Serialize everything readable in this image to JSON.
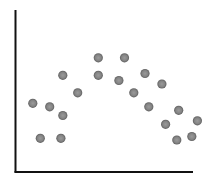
{
  "chart_data": {
    "type": "scatter",
    "title": "",
    "xlabel": "",
    "ylabel": "",
    "grid": false,
    "legend": null,
    "xlim": [
      0,
      100
    ],
    "ylim": [
      0,
      100
    ],
    "ticks": {
      "x": [],
      "y": []
    },
    "series": [
      {
        "name": "points",
        "color": "#808080",
        "points": [
          {
            "x": 9,
            "y": 41
          },
          {
            "x": 18,
            "y": 39
          },
          {
            "x": 25,
            "y": 34
          },
          {
            "x": 13,
            "y": 21
          },
          {
            "x": 24,
            "y": 21
          },
          {
            "x": 25,
            "y": 57
          },
          {
            "x": 33,
            "y": 47
          },
          {
            "x": 44,
            "y": 67
          },
          {
            "x": 44,
            "y": 57
          },
          {
            "x": 58,
            "y": 67
          },
          {
            "x": 55,
            "y": 54
          },
          {
            "x": 63,
            "y": 47
          },
          {
            "x": 69,
            "y": 58
          },
          {
            "x": 71,
            "y": 39
          },
          {
            "x": 78,
            "y": 52
          },
          {
            "x": 80,
            "y": 29
          },
          {
            "x": 87,
            "y": 37
          },
          {
            "x": 86,
            "y": 20
          },
          {
            "x": 94,
            "y": 22
          },
          {
            "x": 97,
            "y": 31
          }
        ]
      }
    ]
  },
  "style": {
    "axis_color": "#111111",
    "point_color": "#808080",
    "point_rim": "#5e5e5e",
    "background": "#ffffff"
  }
}
